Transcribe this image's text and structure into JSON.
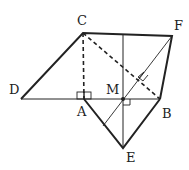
{
  "diagram": {
    "type": "geometry",
    "points": {
      "C": {
        "label": "C",
        "x": 83,
        "y": 33
      },
      "F": {
        "label": "F",
        "x": 172,
        "y": 36
      },
      "D": {
        "label": "D",
        "x": 21,
        "y": 99
      },
      "A": {
        "label": "A",
        "x": 84,
        "y": 99
      },
      "M": {
        "label": "M",
        "x": 123,
        "y": 99
      },
      "B": {
        "label": "B",
        "x": 160,
        "y": 99
      },
      "E": {
        "label": "E",
        "x": 123,
        "y": 148
      }
    },
    "labels": {
      "C": "C",
      "F": "F",
      "D": "D",
      "A": "A",
      "M": "M",
      "B": "B",
      "E": "E"
    },
    "thick_segments": [
      "D-C",
      "C-F",
      "F-B",
      "B-E",
      "E-A"
    ],
    "thin_segments": [
      "D-B",
      "F-M-extension",
      "vertical-through-M"
    ],
    "dashed_segments": [
      "C-A",
      "C-B"
    ],
    "right_angle_marks": [
      "A",
      "M",
      "on-CB-FM"
    ],
    "colors": {
      "stroke": "#222222",
      "background": "#ffffff"
    }
  }
}
